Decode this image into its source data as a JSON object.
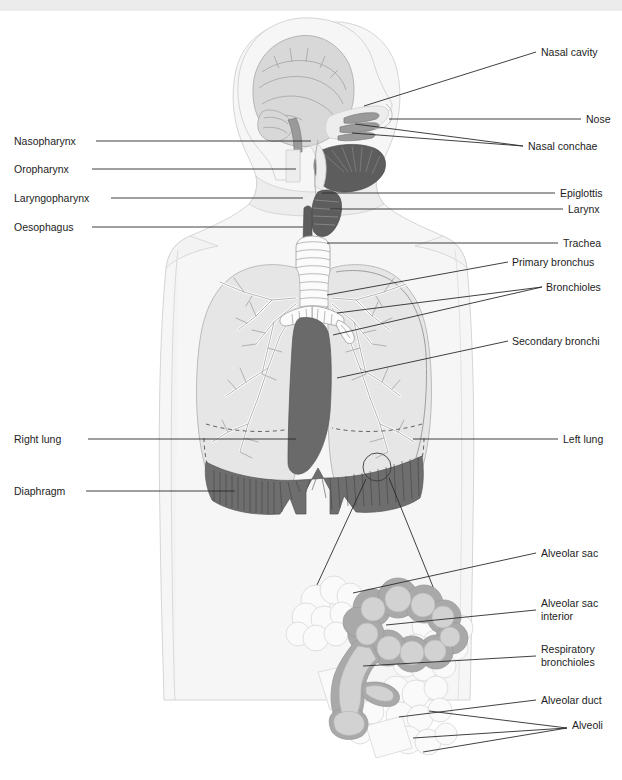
{
  "figure": {
    "background_color": "#ffffff",
    "label_text_color": "#1d1d1d",
    "leader_line_color": "#2b2b2b",
    "accent_dark_color": "#5d5d5d",
    "diaphragm_color": "#6e6e6e",
    "lung_fill_color": "#e6e6e6",
    "body_fill_color": "#f3f3f3"
  },
  "labels_left": [
    {
      "id": "nasopharynx",
      "text": "Nasopharynx",
      "x": 14,
      "y": 145
    },
    {
      "id": "oropharynx",
      "text": "Oropharynx",
      "x": 14,
      "y": 173
    },
    {
      "id": "laryngopharynx",
      "text": "Laryngopharynx",
      "x": 14,
      "y": 202
    },
    {
      "id": "oesophagus",
      "text": "Oesophagus",
      "x": 14,
      "y": 231
    },
    {
      "id": "right-lung",
      "text": "Right lung",
      "x": 14,
      "y": 443
    },
    {
      "id": "diaphragm",
      "text": "Diaphragm",
      "x": 14,
      "y": 495
    }
  ],
  "labels_right": [
    {
      "id": "nasal-cavity",
      "text": "Nasal cavity",
      "x": 541,
      "y": 56
    },
    {
      "id": "nose",
      "text": "Nose",
      "x": 586,
      "y": 123
    },
    {
      "id": "nasal-conchae",
      "text": "Nasal conchae",
      "x": 528,
      "y": 150
    },
    {
      "id": "epiglottis",
      "text": "Epiglottis",
      "x": 560,
      "y": 197
    },
    {
      "id": "larynx",
      "text": "Larynx",
      "x": 568,
      "y": 213
    },
    {
      "id": "trachea",
      "text": "Trachea",
      "x": 563,
      "y": 247
    },
    {
      "id": "primary-bronchus",
      "text": "Primary bronchus",
      "x": 512,
      "y": 266
    },
    {
      "id": "bronchioles",
      "text": "Bronchioles",
      "x": 546,
      "y": 291
    },
    {
      "id": "secondary-bronchi",
      "text": "Secondary bronchi",
      "x": 512,
      "y": 345
    },
    {
      "id": "left-lung",
      "text": "Left lung",
      "x": 563,
      "y": 443
    },
    {
      "id": "alveolar-sac",
      "text": "Alveolar sac",
      "x": 541,
      "y": 557
    },
    {
      "id": "alveolar-sac-int-1",
      "text": "Alveolar sac",
      "x": 541,
      "y": 607
    },
    {
      "id": "alveolar-sac-int-2",
      "text": "interior",
      "x": 541,
      "y": 620
    },
    {
      "id": "respiratory-1",
      "text": "Respiratory",
      "x": 541,
      "y": 653
    },
    {
      "id": "respiratory-2",
      "text": "bronchioles",
      "x": 541,
      "y": 666
    },
    {
      "id": "alveolar-duct",
      "text": "Alveolar duct",
      "x": 541,
      "y": 704
    },
    {
      "id": "alveoli",
      "text": "Alveoli",
      "x": 572,
      "y": 729
    }
  ],
  "leaders_left": [
    {
      "id": "leader-nasopharynx",
      "points": "96,141 311,141"
    },
    {
      "id": "leader-oropharynx",
      "points": "92,169 296,169"
    },
    {
      "id": "leader-laryngopharynx",
      "points": "111,198 303,198"
    },
    {
      "id": "leader-oesophagus",
      "points": "92,227 303,227"
    },
    {
      "id": "leader-right-lung",
      "points": "88,439 296,439"
    },
    {
      "id": "leader-diaphragm",
      "points": "86,491 235,491"
    }
  ],
  "leaders_right": [
    {
      "id": "leader-nasal-cavity",
      "points": "536,52 364,106"
    },
    {
      "id": "leader-nose",
      "points": "581,119 389,119"
    },
    {
      "id": "leader-nasal-conchae",
      "points": "523,146 355,124"
    },
    {
      "id": "leader-nasal-conchae-b",
      "points": "523,146 352,133"
    },
    {
      "id": "leader-epiglottis",
      "points": "555,193 322,193"
    },
    {
      "id": "leader-larynx",
      "points": "563,209 330,209"
    },
    {
      "id": "leader-trachea",
      "points": "558,243 327,243"
    },
    {
      "id": "leader-primary-bronchus",
      "points": "508,262 327,295"
    },
    {
      "id": "leader-bronchioles-a",
      "points": "542,287 333,335"
    },
    {
      "id": "leader-bronchioles-b",
      "points": "542,287 337,313"
    },
    {
      "id": "leader-secondary-bronchi",
      "points": "508,341 337,378"
    },
    {
      "id": "leader-left-lung",
      "points": "558,439 413,439"
    },
    {
      "id": "leader-alveolar-sac",
      "points": "536,553 353,593"
    },
    {
      "id": "leader-alveolar-sac-int",
      "points": "536,610 386,625"
    },
    {
      "id": "leader-respiratory",
      "points": "536,656 363,666"
    },
    {
      "id": "leader-alveolar-duct",
      "points": "536,700 399,717"
    },
    {
      "id": "leader-alveoli-a",
      "points": "567,728 429,711"
    },
    {
      "id": "leader-alveoli-b",
      "points": "567,728 413,738"
    },
    {
      "id": "leader-alveoli-c",
      "points": "567,728 423,752"
    }
  ],
  "magnifier": {
    "circle": {
      "cx": 377,
      "cy": 467,
      "r": 14
    },
    "ray_a": "366,479 310,600",
    "ray_b": "389,478 446,619"
  }
}
